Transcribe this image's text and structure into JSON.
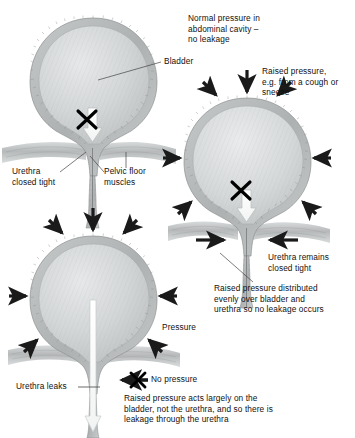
{
  "figure": {
    "background": "#ffffff",
    "ink": "#111111",
    "wall_color": "#b9bcbd",
    "lumen_color": "#d2d5d6",
    "muscle_color": "#c2c5c6",
    "arrow_color": "#1a1a1a",
    "flow_color": "#ffffff"
  },
  "panels": {
    "top_left": {
      "name": "normal-pressure-bladder",
      "caption": "Normal pressure in\nabdominal cavity –\nno leakage",
      "bladder_label": "Bladder",
      "urethra_label": "Urethra\nclosed tight",
      "pelvic_label": "Pelvic floor\nmuscles",
      "block_mark": "✕",
      "flow_blocked": true
    },
    "middle_right": {
      "name": "raised-pressure-continent-bladder",
      "caption": "Raised pressure,\ne.g. from a cough or\nsneeze",
      "urethra_label": "Urethra remains\nclosed tight",
      "explanation": "Raised pressure distributed\nevenly over bladder and\nurethra so no leakage occurs",
      "block_mark": "✕",
      "pressure_arrows": 8
    },
    "bottom_left": {
      "name": "stress-incontinence-bladder",
      "pressure_label": "Pressure",
      "urethra_label": "Urethra leaks",
      "no_pressure_label": "No pressure",
      "explanation": "Raised pressure acts largely on the\nbladder, not the urethra, and so there is\nleakage through the urethra",
      "block_mark": "✕",
      "pressure_arrows": 7,
      "flow_blocked": false
    }
  }
}
